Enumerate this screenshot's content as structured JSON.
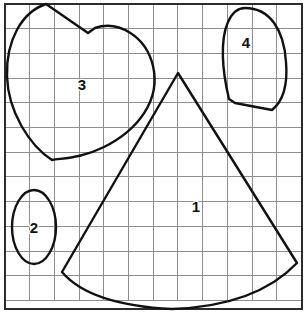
{
  "figure": {
    "width": 305,
    "height": 317,
    "background_color": "#ffffff",
    "grid": {
      "visible": true,
      "line_color": "#8e8e8e",
      "spacing_px": 24.7,
      "columns": 12,
      "rows": 12,
      "origin_x": 5,
      "origin_y": 4,
      "frame_color": "#2b2b2b",
      "frame_width": 2.2,
      "frame_left": 5,
      "frame_top": 4,
      "frame_right": 302,
      "frame_bottom": 309
    },
    "stroke_color": "#111111",
    "stroke_width": 2.4,
    "shapes": [
      {
        "id": "shape-1",
        "label": "1",
        "kind": "circular-sector",
        "label_x": 196,
        "label_y": 206,
        "apex": [
          178,
          73
        ],
        "left_corner": [
          62,
          272
        ],
        "right_corner": [
          297,
          263
        ],
        "arc_low_point": [
          172,
          309
        ],
        "path": "M 178 73 L 62 272 Q 90 305 172 309 Q 256 306 297 263 Z"
      },
      {
        "id": "shape-2",
        "label": "2",
        "kind": "ellipse",
        "label_x": 34,
        "label_y": 227,
        "center": [
          34,
          227
        ],
        "radius_x": 22,
        "radius_y": 37,
        "path": "M 34 190 C 46 190 56 207 56 227 C 56 247 46 264 34 264 C 22 264 12 247 12 227 C 12 207 22 190 34 190 Z"
      },
      {
        "id": "shape-3",
        "label": "3",
        "kind": "heart-leaf",
        "label_x": 82,
        "label_y": 84,
        "left_peak": [
          46,
          4
        ],
        "notch": [
          88,
          33
        ],
        "right_lobe_apex": [
          110,
          28
        ],
        "bottom_tip": [
          52,
          160
        ],
        "path": "M 46 4 L 88 33 L 95 28 C 118 20 146 36 153 66 C 161 100 138 130 104 147 C 82 158 64 158 52 160 C 30 146 8 112 7 76 C 6 40 22 12 46 4 Z"
      },
      {
        "id": "shape-4",
        "label": "4",
        "kind": "rounded-dome",
        "label_x": 246,
        "label_y": 42,
        "top": [
          245,
          8
        ],
        "bottom_left": [
          235,
          103
        ],
        "bottom_right": [
          272,
          110
        ],
        "path": "M 245 8 C 270 8 284 30 286 62 C 288 86 282 102 272 110 L 235 103 L 229 99 C 222 70 220 40 228 22 C 232 13 238 8 245 8 Z"
      }
    ]
  }
}
